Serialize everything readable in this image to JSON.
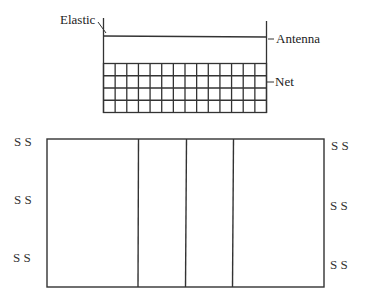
{
  "labels": {
    "elastic": "Elastic",
    "antenna": "Antenna",
    "net": "Net"
  },
  "player_marker": "S S",
  "court": {
    "left_markers": [
      "S S",
      "S S",
      "S S"
    ],
    "right_markers": [
      "S S",
      "S S",
      "S S"
    ],
    "vertical_dividers": 3
  },
  "net_grid": {
    "columns": 14,
    "rows": 4
  },
  "colors": {
    "line": "#333333",
    "background": "#ffffff"
  }
}
